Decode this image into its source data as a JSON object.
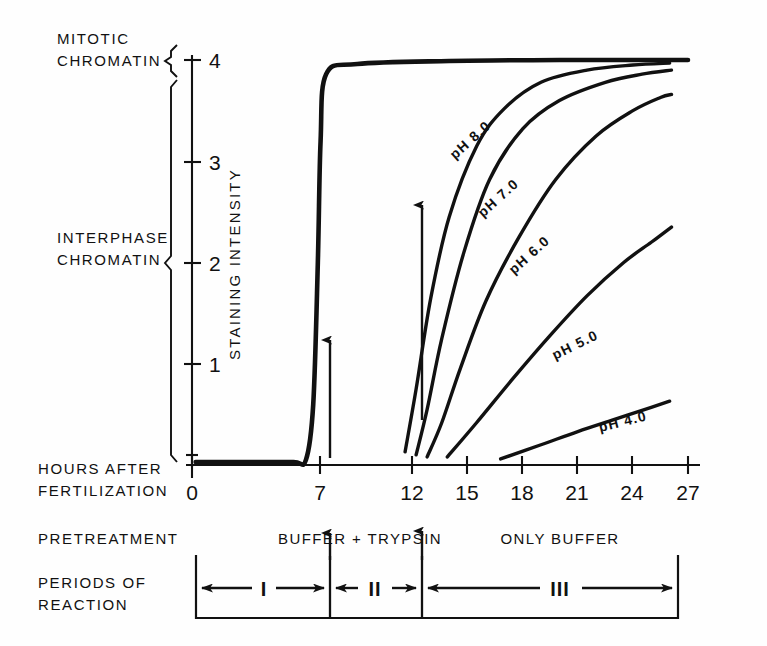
{
  "figure": {
    "left_labels": {
      "mitotic_line1": "MITOTIC",
      "mitotic_line2": "CHROMATIN",
      "interphase_line1": "INTERPHASE",
      "interphase_line2": "CHROMATIN",
      "hours_line1": "HOURS AFTER",
      "hours_line2": "FERTILIZATION",
      "pretreatment": "PRETREATMENT",
      "periods_line1": "PERIODS OF",
      "periods_line2": "REACTION"
    },
    "y_axis_title": "STAINING INTENSITY",
    "pretreatment_zones": {
      "left": "BUFFER + TRYPSIN",
      "right": "ONLY BUFFER"
    },
    "periods": [
      {
        "label": "I"
      },
      {
        "label": "II"
      },
      {
        "label": "III"
      }
    ],
    "ink_color": "#111111"
  },
  "chart_data": {
    "type": "line",
    "title": "",
    "xlabel": "HOURS AFTER FERTILIZATION",
    "ylabel": "STAINING INTENSITY",
    "xlim": [
      0,
      27
    ],
    "ylim": [
      0,
      4
    ],
    "grid": false,
    "legend": "inline curve labels",
    "x_ticks": [
      0,
      7,
      12,
      15,
      18,
      21,
      24,
      27
    ],
    "x_tick_labels": [
      "0",
      "7",
      "12",
      "15",
      "18",
      "21",
      "24",
      "27"
    ],
    "y_ticks": [
      1,
      2,
      3,
      4
    ],
    "y_tick_labels": [
      "1",
      "2",
      "3",
      "4"
    ],
    "series": [
      {
        "name": "mitotic plateau",
        "label": "",
        "x": [
          0.2,
          3.0,
          5.5,
          6.2,
          6.6,
          6.85,
          7.0,
          7.3,
          9.0,
          14.0,
          20.0,
          27.0
        ],
        "y": [
          0.03,
          0.03,
          0.03,
          0.05,
          0.6,
          2.0,
          3.2,
          3.86,
          3.96,
          3.99,
          4.0,
          4.0
        ]
      },
      {
        "name": "pH 8.0",
        "label": "pH 8.0",
        "x": [
          11.6,
          12.2,
          13.0,
          14.0,
          15.5,
          17.0,
          19.0,
          21.5,
          24.0,
          26.0
        ],
        "y": [
          0.13,
          0.75,
          1.65,
          2.45,
          3.15,
          3.52,
          3.78,
          3.9,
          3.95,
          3.97
        ]
      },
      {
        "name": "pH 7.0",
        "label": "pH 7.0",
        "x": [
          12.2,
          12.8,
          13.6,
          14.8,
          16.2,
          18.0,
          20.0,
          22.5,
          24.5,
          26.1
        ],
        "y": [
          0.1,
          0.55,
          1.25,
          2.1,
          2.82,
          3.32,
          3.6,
          3.78,
          3.86,
          3.9
        ]
      },
      {
        "name": "pH 6.0",
        "label": "pH 6.0",
        "x": [
          12.8,
          13.6,
          14.6,
          16.0,
          17.8,
          19.8,
          22.0,
          24.0,
          25.5,
          26.1
        ],
        "y": [
          0.08,
          0.42,
          0.95,
          1.62,
          2.25,
          2.82,
          3.25,
          3.5,
          3.63,
          3.66
        ]
      },
      {
        "name": "pH 5.0",
        "label": "pH 5.0",
        "x": [
          13.9,
          15.5,
          17.5,
          19.5,
          21.5,
          23.5,
          25.0,
          26.1
        ],
        "y": [
          0.08,
          0.42,
          0.86,
          1.28,
          1.67,
          2.0,
          2.2,
          2.35
        ]
      },
      {
        "name": "pH 4.0",
        "label": "pH 4.0",
        "x": [
          16.8,
          19.0,
          21.0,
          23.0,
          25.0,
          26.0
        ],
        "y": [
          0.06,
          0.2,
          0.33,
          0.45,
          0.57,
          0.63
        ]
      }
    ],
    "annotations": [
      {
        "type": "arrow",
        "name": "trypsin-onset-arrow",
        "x": 7.6,
        "y_from": 0.1,
        "y_to": 1.55
      },
      {
        "type": "arrow",
        "name": "buffer-onset-arrow",
        "x": 12.1,
        "y_from": 0.45,
        "y_to": 2.95
      },
      {
        "type": "region-brace",
        "name": "mitotic-chromatin-brace",
        "y_from": 3.78,
        "y_to": 4.0
      },
      {
        "type": "region-brace",
        "name": "interphase-chromatin-brace",
        "y_from": 0.0,
        "y_to": 3.7
      }
    ]
  }
}
